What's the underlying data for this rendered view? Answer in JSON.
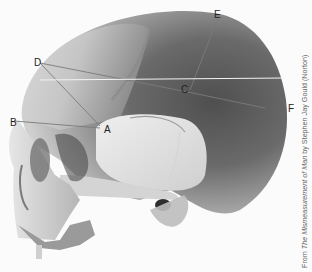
{
  "figure": {
    "landmarks": [
      {
        "id": "A",
        "x": 100,
        "y": 126
      },
      {
        "id": "B",
        "x": 10,
        "y": 121
      },
      {
        "id": "C",
        "x": 185,
        "y": 89
      },
      {
        "id": "D",
        "x": 35,
        "y": 61
      },
      {
        "id": "E",
        "x": 214,
        "y": 12
      },
      {
        "id": "F",
        "x": 268,
        "y": 109
      }
    ],
    "lines": [
      [
        "B",
        "A"
      ],
      [
        "D",
        "A"
      ],
      [
        "D",
        "C"
      ],
      [
        "C",
        "F"
      ],
      [
        "E",
        "C"
      ]
    ],
    "colors": {
      "background": "#fbfbfb",
      "bone_light": "#e8e8e8",
      "bone_mid": "#bdbdbd",
      "bone_dark": "#5a5a5a",
      "line": "#7a7a7a"
    }
  },
  "caption": {
    "prefix": "From ",
    "title": "The Mismeasurement of Man",
    "suffix": " by Stephen Jay Gould (Norton)"
  }
}
